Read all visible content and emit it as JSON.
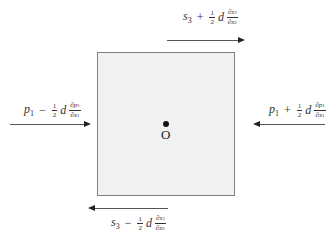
{
  "diagram": {
    "origin_label": "O",
    "labels": {
      "top": {
        "symbol": "s",
        "subscript": "3",
        "operator": "+",
        "half": {
          "num": "1",
          "den": "2"
        },
        "d": "d",
        "deriv": {
          "num": "∂s",
          "num_sub": "3",
          "den": "∂x",
          "den_sub": "2"
        }
      },
      "bottom": {
        "symbol": "s",
        "subscript": "3",
        "operator": "−",
        "half": {
          "num": "1",
          "den": "2"
        },
        "d": "d",
        "deriv": {
          "num": "∂s",
          "num_sub": "3",
          "den": "∂x",
          "den_sub": "2"
        }
      },
      "left": {
        "symbol": "p",
        "subscript": "1",
        "operator": "−",
        "half": {
          "num": "1",
          "den": "2"
        },
        "d": "d",
        "deriv": {
          "num": "∂p",
          "num_sub": "1",
          "den": "∂x",
          "den_sub": "1"
        }
      },
      "right": {
        "symbol": "p",
        "subscript": "1",
        "operator": "+",
        "half": {
          "num": "1",
          "den": "2"
        },
        "d": "d",
        "deriv": {
          "num": "∂p",
          "num_sub": "1",
          "den": "∂x",
          "den_sub": "1"
        }
      }
    },
    "arrows": {
      "top": "right",
      "bottom": "left",
      "left": "right",
      "right": "left"
    }
  }
}
